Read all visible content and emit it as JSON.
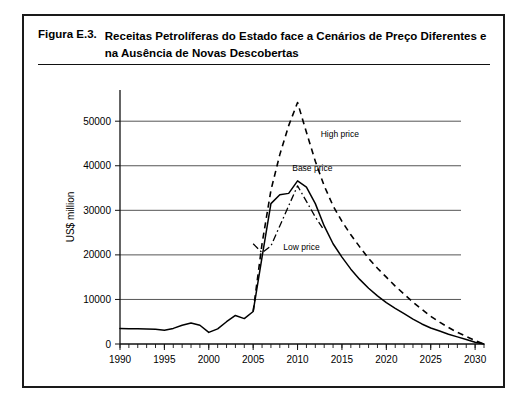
{
  "figure": {
    "number": "Figura E.3.",
    "title": "Receitas Petrolíferas do Estado face a Cenários de Preço Diferentes e na Ausência de Novas Descobertas"
  },
  "chart_data": {
    "type": "line",
    "title": "Receitas Petrolíferas do Estado face a Cenários de Preço Diferentes e na Ausência de Novas Descobertas",
    "xlabel": "",
    "ylabel": "US$ million",
    "xlim": [
      1990,
      2031
    ],
    "ylim": [
      0,
      57000
    ],
    "yticks": [
      0,
      10000,
      20000,
      30000,
      40000,
      50000
    ],
    "ytick_labels": [
      "0",
      "10000",
      "20000",
      "30000",
      "40000",
      "50000"
    ],
    "xticks": [
      1990,
      1995,
      2000,
      2005,
      2010,
      2015,
      2020,
      2025,
      2030
    ],
    "xtick_labels": [
      "1990",
      "1995",
      "2000",
      "2005",
      "2010",
      "2015",
      "2020",
      "2025",
      "2030"
    ],
    "minor_xtick_interval": 1,
    "grid": "horizontal",
    "legend": "inline-annotations",
    "annotations": [
      {
        "label": "High price",
        "x": 2012.6,
        "y": 46500
      },
      {
        "label": "Base price",
        "x": 2009.4,
        "y": 38800
      },
      {
        "label": "Low price",
        "x": 2008.4,
        "y": 21000
      }
    ],
    "series": [
      {
        "name": "Base price",
        "style": "solid",
        "x": [
          1990,
          1991,
          1992,
          1993,
          1994,
          1995,
          1996,
          1997,
          1998,
          1999,
          2000,
          2001,
          2002,
          2003,
          2004,
          2005,
          2006,
          2007,
          2008,
          2009,
          2010,
          2011,
          2012,
          2013,
          2014,
          2015,
          2016,
          2017,
          2018,
          2019,
          2020,
          2021,
          2022,
          2023,
          2024,
          2025,
          2026,
          2027,
          2028,
          2029,
          2030,
          2031
        ],
        "values": [
          3500,
          3450,
          3400,
          3350,
          3300,
          3100,
          3500,
          4200,
          4700,
          4200,
          2600,
          3400,
          5000,
          6400,
          5700,
          7300,
          19500,
          31500,
          33500,
          33800,
          36600,
          35200,
          31500,
          26500,
          22500,
          19500,
          16800,
          14500,
          12500,
          10800,
          9300,
          8000,
          6800,
          5600,
          4500,
          3600,
          2900,
          2200,
          1600,
          1000,
          400,
          0
        ]
      },
      {
        "name": "High price",
        "style": "dashed",
        "x": [
          2005,
          2006,
          2007,
          2008,
          2009,
          2010,
          2011,
          2012,
          2013,
          2014,
          2015,
          2016,
          2017,
          2018,
          2019,
          2020,
          2021,
          2022,
          2023,
          2024,
          2025,
          2026,
          2027,
          2028,
          2029,
          2030,
          2031
        ],
        "values": [
          7300,
          22500,
          34500,
          42500,
          49000,
          54200,
          47500,
          41000,
          35500,
          31000,
          27500,
          24500,
          21800,
          19200,
          17000,
          15000,
          13000,
          11200,
          9400,
          7800,
          6200,
          4900,
          3700,
          2600,
          1700,
          800,
          0
        ]
      },
      {
        "name": "Low price",
        "style": "dash-dot",
        "x": [
          2005,
          2006,
          2007,
          2008,
          2009,
          2010,
          2011,
          2012,
          2013
        ],
        "values": [
          22500,
          20500,
          22000,
          26500,
          31000,
          35500,
          32000,
          28500,
          25500
        ]
      }
    ]
  }
}
